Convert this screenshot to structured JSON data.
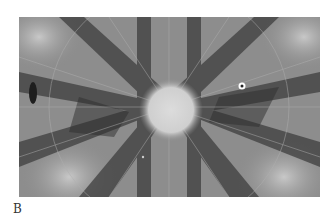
{
  "figure": {
    "panel_label": "B",
    "image": {
      "kind": "grayscale diffraction (Kikuchi) pattern",
      "features": [
        "bright-central-pole",
        "radiating-dark-bands",
        "small-bright-marker-ring"
      ]
    },
    "colors": {
      "background": "#ffffff",
      "pattern_mid": "#8a8a8a",
      "band_dark": "#3c3c3c",
      "pole_bright": "#d8d8d8"
    }
  }
}
